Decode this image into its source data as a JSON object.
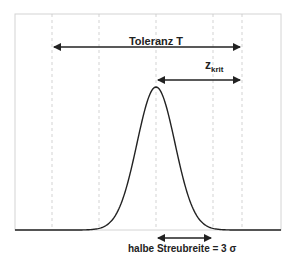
{
  "diagram": {
    "tolerance_label": "Toleranz T",
    "zkrit_main": "z",
    "zkrit_sub": "krit",
    "spread_label": "halbe Streubreite = 3 σ",
    "colors": {
      "curve": "#222222",
      "arrows": "#222222",
      "frame": "#d0d0d0",
      "gridlines": "#c8c8c8",
      "text": "#222222"
    },
    "gridlines_x": [
      52,
      99,
      156,
      213,
      242
    ],
    "peak": {
      "x": 156,
      "y": 87
    },
    "baseline_y": 230
  }
}
